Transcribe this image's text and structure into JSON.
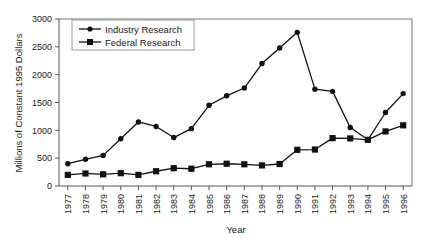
{
  "chart_data": {
    "type": "line",
    "title": "",
    "xlabel": "Year",
    "ylabel": "Millions of Constant 1995 Dollars",
    "x": [
      1977,
      1978,
      1979,
      1980,
      1981,
      1982,
      1983,
      1984,
      1985,
      1986,
      1987,
      1988,
      1989,
      1990,
      1991,
      1992,
      1993,
      1994,
      1995,
      1996
    ],
    "categories": [
      "1977",
      "1978",
      "1979",
      "1980",
      "1981",
      "1982",
      "1983",
      "1984",
      "1985",
      "1986",
      "1987",
      "1988",
      "1989",
      "1990",
      "1991",
      "1992",
      "1993",
      "1994",
      "1995",
      "1996"
    ],
    "series": [
      {
        "name": "Industry Research",
        "marker": "circle",
        "values": [
          400,
          480,
          550,
          850,
          1150,
          1070,
          870,
          1030,
          1450,
          1620,
          1760,
          2200,
          2480,
          2760,
          1740,
          1700,
          1050,
          830,
          1320,
          1660
        ]
      },
      {
        "name": "Federal Research",
        "marker": "square",
        "values": [
          200,
          225,
          210,
          230,
          200,
          265,
          320,
          310,
          390,
          400,
          390,
          370,
          395,
          650,
          655,
          860,
          855,
          830,
          980,
          1090
        ]
      }
    ],
    "ylim": [
      0,
      3000
    ],
    "yticks": [
      0,
      500,
      1000,
      1500,
      2000,
      2500,
      3000
    ],
    "yticklabels": [
      "0",
      "500",
      "1000",
      "1500",
      "2000",
      "2500",
      "3000"
    ],
    "grid": false,
    "legend_position": "upper-left",
    "legend_entries": [
      "Industry Research",
      "Federal Research"
    ],
    "colors": {
      "industry": "#111111",
      "federal": "#111111",
      "axis": "#555555",
      "frame": "#777777",
      "background": "#ffffff"
    }
  }
}
